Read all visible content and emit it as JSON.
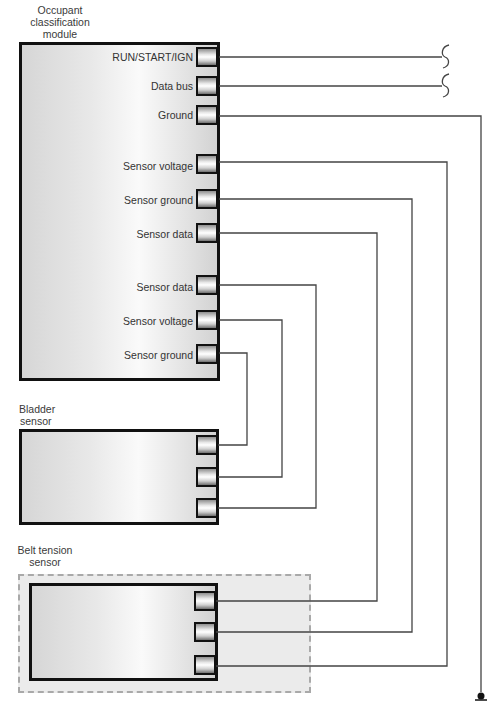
{
  "colors": {
    "wire": "#444444",
    "border": "#111111",
    "dashed_border": "#a9a9a9",
    "text": "#333333"
  },
  "module": {
    "title_lines": [
      "Occupant",
      "classification",
      "module"
    ],
    "pins": [
      {
        "label": "RUN/START/IGN",
        "y": 57
      },
      {
        "label": "Data bus",
        "y": 86
      },
      {
        "label": "Ground",
        "y": 114
      },
      {
        "label": "Sensor voltage",
        "y": 163
      },
      {
        "label": "Sensor ground",
        "y": 199
      },
      {
        "label": "Sensor data",
        "y": 233
      },
      {
        "label": "Sensor data",
        "y": 285
      },
      {
        "label": "Sensor voltage",
        "y": 320
      },
      {
        "label": "Sensor ground",
        "y": 353
      }
    ]
  },
  "bladder_sensor": {
    "title_lines": [
      "Bladder",
      "sensor"
    ],
    "terminals_y": [
      445,
      477,
      508
    ]
  },
  "belt_tension_sensor": {
    "title_lines": [
      "Belt tension",
      "sensor"
    ],
    "terminals_y": [
      601,
      632,
      666
    ]
  },
  "wires": [
    {
      "from": "RUN/START/IGN",
      "points": [
        [
          219,
          57
        ],
        [
          442,
          57
        ]
      ],
      "end": "break"
    },
    {
      "from": "Data bus",
      "points": [
        [
          219,
          86
        ],
        [
          442,
          86
        ]
      ],
      "end": "break"
    },
    {
      "from": "Ground",
      "points": [
        [
          219,
          116
        ],
        [
          481,
          116
        ],
        [
          481,
          692
        ]
      ],
      "end": "ground"
    },
    {
      "from": "Sensor voltage (belt)",
      "points": [
        [
          219,
          162
        ],
        [
          447,
          162
        ],
        [
          447,
          666
        ],
        [
          216,
          666
        ]
      ]
    },
    {
      "from": "Sensor ground (belt)",
      "points": [
        [
          219,
          199
        ],
        [
          412,
          199
        ],
        [
          412,
          632
        ],
        [
          216,
          632
        ]
      ]
    },
    {
      "from": "Sensor data (belt)",
      "points": [
        [
          219,
          233
        ],
        [
          377,
          233
        ],
        [
          377,
          601
        ],
        [
          216,
          601
        ]
      ]
    },
    {
      "from": "Sensor data (bladder)",
      "points": [
        [
          219,
          285
        ],
        [
          316,
          285
        ],
        [
          316,
          508
        ],
        [
          218,
          508
        ]
      ]
    },
    {
      "from": "Sensor voltage (bladder)",
      "points": [
        [
          219,
          320
        ],
        [
          282,
          320
        ],
        [
          282,
          477
        ],
        [
          218,
          477
        ]
      ]
    },
    {
      "from": "Sensor ground (bladder)",
      "points": [
        [
          219,
          353
        ],
        [
          247,
          353
        ],
        [
          247,
          445
        ],
        [
          218,
          445
        ]
      ]
    }
  ],
  "symbols": {
    "breaks": [
      {
        "x": 445,
        "y": 57
      },
      {
        "x": 445,
        "y": 86
      }
    ],
    "ground": {
      "x": 481,
      "y": 696
    }
  }
}
